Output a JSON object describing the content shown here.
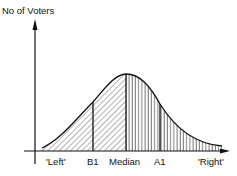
{
  "diagram": {
    "y_axis_label": "No of Voters",
    "x_labels": [
      {
        "text": "'Left'",
        "x": 57
      },
      {
        "text": "B1",
        "x": 93
      },
      {
        "text": "Median",
        "x": 126
      },
      {
        "text": "A1",
        "x": 160
      },
      {
        "text": "'Right'",
        "x": 210
      }
    ],
    "curve": "normal distribution of voters along left-right spectrum",
    "divisions": [
      "B1",
      "Median",
      "A1"
    ],
    "shading": {
      "left_of_median": "diagonal hatching",
      "right_of_median": "vertical hatching"
    },
    "colors": {
      "ink": "#111111",
      "background": "#ffffff"
    }
  }
}
